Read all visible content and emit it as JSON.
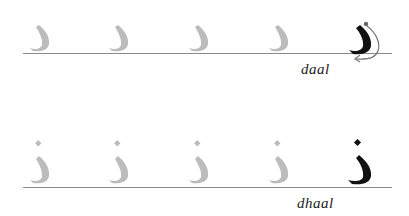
{
  "rows": [
    {
      "letter_name": "daal",
      "trace_count": 4,
      "has_dot": false,
      "has_stroke_arrow": true,
      "colors": {
        "trace": "#bcbcbc",
        "model": "#111111",
        "line": "#8a8a8a"
      }
    },
    {
      "letter_name": "dhaal",
      "trace_count": 4,
      "has_dot": true,
      "has_stroke_arrow": false,
      "colors": {
        "trace": "#bcbcbc",
        "model": "#111111",
        "line": "#8a8a8a"
      }
    }
  ]
}
